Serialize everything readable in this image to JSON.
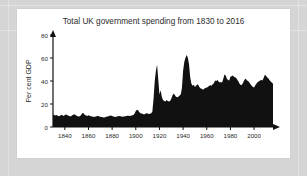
{
  "figure": {
    "background_color": "#d5d5d5",
    "card_color": "#ffffff",
    "ink_color": "#111111"
  },
  "chart_data": {
    "type": "area",
    "title": "Total UK government spending from 1830 to 2016",
    "xlabel": "",
    "ylabel": "Per cent GDP",
    "xlim": [
      1830,
      2016
    ],
    "ylim": [
      0,
      85
    ],
    "grid": false,
    "legend": null,
    "x_ticks": [
      1840,
      1860,
      1880,
      1900,
      1920,
      1940,
      1960,
      1980,
      2000
    ],
    "y_ticks": [
      0,
      20,
      40,
      60,
      80
    ],
    "series_name": "Total UK government spending",
    "fill_color": "#111111",
    "x": [
      1830,
      1831,
      1832,
      1833,
      1834,
      1835,
      1836,
      1837,
      1838,
      1839,
      1840,
      1841,
      1842,
      1843,
      1844,
      1845,
      1846,
      1847,
      1848,
      1849,
      1850,
      1851,
      1852,
      1853,
      1854,
      1855,
      1856,
      1857,
      1858,
      1859,
      1860,
      1861,
      1862,
      1863,
      1864,
      1865,
      1866,
      1867,
      1868,
      1869,
      1870,
      1871,
      1872,
      1873,
      1874,
      1875,
      1876,
      1877,
      1878,
      1879,
      1880,
      1881,
      1882,
      1883,
      1884,
      1885,
      1886,
      1887,
      1888,
      1889,
      1890,
      1891,
      1892,
      1893,
      1894,
      1895,
      1896,
      1897,
      1898,
      1899,
      1900,
      1901,
      1902,
      1903,
      1904,
      1905,
      1906,
      1907,
      1908,
      1909,
      1910,
      1911,
      1912,
      1913,
      1914,
      1915,
      1916,
      1917,
      1918,
      1919,
      1920,
      1921,
      1922,
      1923,
      1924,
      1925,
      1926,
      1927,
      1928,
      1929,
      1930,
      1931,
      1932,
      1933,
      1934,
      1935,
      1936,
      1937,
      1938,
      1939,
      1940,
      1941,
      1942,
      1943,
      1944,
      1945,
      1946,
      1947,
      1948,
      1949,
      1950,
      1951,
      1952,
      1953,
      1954,
      1955,
      1956,
      1957,
      1958,
      1959,
      1960,
      1961,
      1962,
      1963,
      1964,
      1965,
      1966,
      1967,
      1968,
      1969,
      1970,
      1971,
      1972,
      1973,
      1974,
      1975,
      1976,
      1977,
      1978,
      1979,
      1980,
      1981,
      1982,
      1983,
      1984,
      1985,
      1986,
      1987,
      1988,
      1989,
      1990,
      1991,
      1992,
      1993,
      1994,
      1995,
      1996,
      1997,
      1998,
      1999,
      2000,
      2001,
      2002,
      2003,
      2004,
      2005,
      2006,
      2007,
      2008,
      2009,
      2010,
      2011,
      2012,
      2013,
      2014,
      2015,
      2016
    ],
    "values": [
      11.5,
      11.0,
      10.6,
      11.2,
      10.4,
      10.0,
      10.3,
      11.4,
      10.8,
      10.2,
      11.0,
      11.6,
      11.1,
      10.5,
      10.1,
      9.8,
      10.6,
      11.3,
      11.8,
      11.0,
      10.4,
      9.9,
      9.6,
      10.2,
      11.6,
      13.0,
      12.4,
      11.0,
      10.6,
      10.2,
      10.8,
      10.4,
      10.0,
      9.7,
      9.4,
      9.2,
      9.6,
      10.0,
      10.3,
      9.8,
      9.5,
      9.2,
      9.0,
      8.8,
      9.1,
      9.4,
      9.6,
      9.9,
      10.3,
      10.6,
      10.2,
      9.8,
      9.5,
      9.3,
      9.6,
      10.0,
      10.2,
      9.9,
      9.6,
      9.4,
      9.7,
      10.0,
      10.2,
      10.5,
      10.3,
      10.1,
      10.4,
      10.8,
      11.2,
      12.4,
      14.8,
      16.0,
      15.4,
      13.6,
      12.8,
      12.4,
      12.0,
      11.6,
      12.2,
      12.8,
      12.4,
      12.0,
      12.2,
      12.6,
      14.0,
      26.0,
      42.0,
      52.0,
      57.5,
      44.0,
      30.0,
      34.0,
      28.0,
      25.0,
      24.0,
      23.5,
      25.0,
      24.0,
      23.5,
      24.0,
      26.0,
      29.0,
      31.0,
      29.5,
      28.0,
      27.5,
      28.0,
      29.0,
      30.0,
      36.0,
      52.0,
      60.0,
      64.0,
      66.5,
      64.0,
      58.0,
      46.0,
      40.0,
      38.0,
      39.0,
      37.0,
      38.0,
      39.5,
      38.5,
      36.5,
      35.5,
      35.0,
      34.5,
      35.5,
      36.0,
      36.5,
      37.0,
      38.0,
      38.5,
      38.0,
      39.5,
      40.5,
      43.0,
      42.5,
      43.5,
      42.0,
      41.0,
      41.5,
      41.0,
      44.5,
      48.5,
      47.5,
      44.5,
      43.5,
      43.0,
      46.5,
      47.0,
      47.5,
      46.5,
      46.0,
      45.0,
      43.5,
      41.5,
      39.5,
      38.5,
      39.5,
      41.5,
      44.0,
      44.5,
      43.0,
      42.5,
      41.0,
      39.5,
      38.0,
      37.0,
      36.5,
      38.5,
      40.0,
      41.5,
      42.0,
      43.0,
      43.5,
      43.0,
      45.0,
      48.0,
      47.5,
      46.0,
      45.0,
      43.5,
      42.0,
      41.0,
      40.0
    ]
  },
  "axes": {
    "y_axis_title": "Per cent GDP",
    "y_tick_labels": [
      "0",
      "20",
      "40",
      "60",
      "80"
    ],
    "x_tick_labels": [
      "1840",
      "1860",
      "1880",
      "1900",
      "1920",
      "1940",
      "1960",
      "1980",
      "2000"
    ],
    "y_arrow": "arrow-up-icon",
    "x_arrow": "arrow-right-icon"
  }
}
